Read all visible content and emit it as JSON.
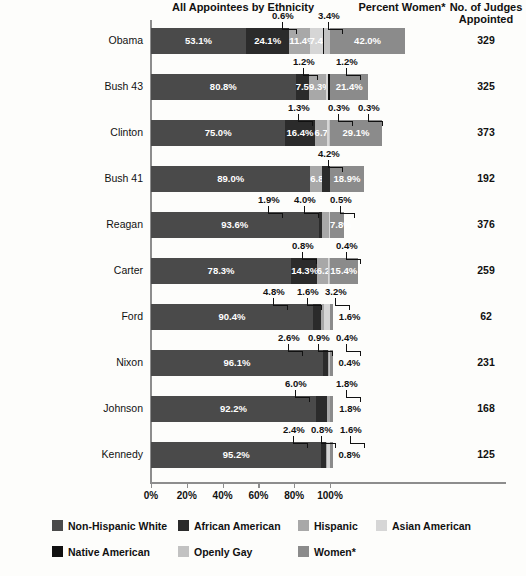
{
  "header": {
    "ethnicity_title": "All Appointees by Ethnicity",
    "women_title": "Percent Women*",
    "judges_title_line1": "No. of Judges",
    "judges_title_line2": "Appointed"
  },
  "axis": {
    "ticks": [
      "0%",
      "20%",
      "40%",
      "60%",
      "80%",
      "100%"
    ],
    "tick_values": [
      0,
      20,
      40,
      60,
      80,
      100
    ]
  },
  "legend": {
    "items": [
      {
        "label": "Non-Hispanic White",
        "color": "#4a4a4a"
      },
      {
        "label": "African American",
        "color": "#2b2b2b"
      },
      {
        "label": "Hispanic",
        "color": "#a8a8a8"
      },
      {
        "label": "Asian American",
        "color": "#d6d6d6"
      },
      {
        "label": "Native American",
        "color": "#111111"
      },
      {
        "label": "Openly Gay",
        "color": "#c2c2c2"
      },
      {
        "label": "Women*",
        "color": "#8b8b8b"
      }
    ]
  },
  "chart_data": {
    "type": "bar",
    "xlabel": "",
    "ylabel": "",
    "xlim": [
      0,
      100
    ],
    "grid": false,
    "orientation": "horizontal",
    "stacked": true,
    "legend_position": "bottom",
    "categories": [
      "Obama",
      "Bush 43",
      "Clinton",
      "Bush 41",
      "Reagan",
      "Carter",
      "Ford",
      "Nixon",
      "Johnson",
      "Kennedy"
    ],
    "series": [
      {
        "name": "Non-Hispanic White",
        "color": "#4a4a4a",
        "values": [
          53.1,
          80.8,
          75.0,
          89.0,
          93.6,
          78.3,
          90.4,
          96.1,
          92.2,
          95.2
        ]
      },
      {
        "name": "African American",
        "color": "#2b2b2b",
        "values": [
          24.1,
          7.5,
          16.4,
          6.8,
          1.9,
          14.3,
          4.8,
          2.6,
          6.0,
          2.4
        ]
      },
      {
        "name": "Hispanic",
        "color": "#a8a8a8",
        "values": [
          11.4,
          9.3,
          6.7,
          4.2,
          4.0,
          6.2,
          1.6,
          0.9,
          1.8,
          0.8
        ]
      },
      {
        "name": "Asian American",
        "color": "#d6d6d6",
        "values": [
          7.4,
          1.2,
          1.3,
          0.0,
          0.5,
          0.8,
          3.2,
          0.4,
          0.0,
          1.6
        ]
      },
      {
        "name": "Native American",
        "color": "#111111",
        "values": [
          0.6,
          1.2,
          0.3,
          0.0,
          0.0,
          0.0,
          0.0,
          0.0,
          0.0,
          0.0
        ]
      },
      {
        "name": "Openly Gay",
        "color": "#c2c2c2",
        "values": [
          3.4,
          0.3,
          0.0,
          0.0,
          0.0,
          0.4,
          1.6,
          0.4,
          1.8,
          0.8
        ]
      },
      {
        "name": "Women*",
        "color": "#8b8b8b",
        "values": [
          42.0,
          21.4,
          29.1,
          18.9,
          7.8,
          15.4,
          1.6,
          0.4,
          1.8,
          0.8
        ]
      }
    ],
    "judges_appointed": [
      329,
      325,
      373,
      192,
      376,
      259,
      62,
      231,
      168,
      125
    ]
  },
  "rows": [
    {
      "label": "Obama",
      "judges": "329",
      "segments": [
        {
          "name": "Non-Hispanic White",
          "value": 53.1,
          "text": "53.1%",
          "color": "#4a4a4a",
          "inline": true
        },
        {
          "name": "African American",
          "value": 24.1,
          "text": "24.1%",
          "color": "#2b2b2b",
          "inline": true
        },
        {
          "name": "Hispanic",
          "value": 11.4,
          "text": "11.4%",
          "color": "#a8a8a8",
          "inline": true
        },
        {
          "name": "Asian American",
          "value": 7.4,
          "text": "7.4%",
          "color": "#d6d6d6",
          "inline": true
        },
        {
          "name": "Native American",
          "value": 0.6,
          "text": "",
          "color": "#111111",
          "inline": false
        },
        {
          "name": "Openly Gay",
          "value": 3.4,
          "text": "",
          "color": "#c2c2c2",
          "inline": false
        }
      ],
      "women": {
        "value": 42.0,
        "text": "42.0%"
      },
      "callouts": [
        {
          "text": "0.6%",
          "x": 272,
          "y": -18,
          "leader_from": 297,
          "leader_to": 301,
          "style": "bracket-right"
        },
        {
          "text": "3.4%",
          "x": 318,
          "y": -18,
          "leader_from": 332,
          "leader_to": 336,
          "style": "bracket-left"
        }
      ]
    },
    {
      "label": "Bush 43",
      "judges": "325",
      "segments": [
        {
          "name": "Non-Hispanic White",
          "value": 80.8,
          "text": "80.8%",
          "color": "#4a4a4a",
          "inline": true
        },
        {
          "name": "African American",
          "value": 7.5,
          "text": "7.5%",
          "color": "#2b2b2b",
          "inline": true
        },
        {
          "name": "Hispanic",
          "value": 9.3,
          "text": "9.3%",
          "color": "#a8a8a8",
          "inline": true
        },
        {
          "name": "Asian American",
          "value": 1.2,
          "text": "",
          "color": "#d6d6d6",
          "inline": false
        },
        {
          "name": "Native American",
          "value": 1.2,
          "text": "",
          "color": "#111111",
          "inline": false
        }
      ],
      "women": {
        "value": 21.4,
        "text": "21.4%"
      },
      "callouts": [
        {
          "text": "1.2%",
          "x": 293,
          "y": -18
        },
        {
          "text": "1.2%",
          "x": 336,
          "y": -18
        }
      ]
    },
    {
      "label": "Clinton",
      "judges": "373",
      "segments": [
        {
          "name": "Non-Hispanic White",
          "value": 75.0,
          "text": "75.0%",
          "color": "#4a4a4a",
          "inline": true
        },
        {
          "name": "African American",
          "value": 16.4,
          "text": "16.4%",
          "color": "#2b2b2b",
          "inline": true
        },
        {
          "name": "Hispanic",
          "value": 6.7,
          "text": "6.7%",
          "color": "#a8a8a8",
          "inline": true
        },
        {
          "name": "Asian American",
          "value": 1.3,
          "text": "",
          "color": "#d6d6d6",
          "inline": false
        },
        {
          "name": "Native American",
          "value": 0.3,
          "text": "",
          "color": "#111111",
          "inline": false
        },
        {
          "name": "Openly Gay",
          "value": 0.3,
          "text": "",
          "color": "#c2c2c2",
          "inline": false
        }
      ],
      "women": {
        "value": 29.1,
        "text": "29.1%"
      },
      "callouts": [
        {
          "text": "1.3%",
          "x": 288,
          "y": -18
        },
        {
          "text": "0.3%",
          "x": 328,
          "y": -18
        },
        {
          "text": "0.3%",
          "x": 358,
          "y": -18
        }
      ]
    },
    {
      "label": "Bush 41",
      "judges": "192",
      "segments": [
        {
          "name": "Non-Hispanic White",
          "value": 89.0,
          "text": "89.0%",
          "color": "#4a4a4a",
          "inline": true
        },
        {
          "name": "Hispanic",
          "value": 6.8,
          "text": "6.8%",
          "color": "#a8a8a8",
          "inline": true
        },
        {
          "name": "African American",
          "value": 4.2,
          "text": "",
          "color": "#2b2b2b",
          "inline": false
        }
      ],
      "women": {
        "value": 18.9,
        "text": "18.9%"
      },
      "callouts": [
        {
          "text": "4.2%",
          "x": 318,
          "y": -18
        }
      ]
    },
    {
      "label": "Reagan",
      "judges": "376",
      "segments": [
        {
          "name": "Non-Hispanic White",
          "value": 93.6,
          "text": "93.6%",
          "color": "#4a4a4a",
          "inline": true
        },
        {
          "name": "African American",
          "value": 1.9,
          "text": "",
          "color": "#2b2b2b",
          "inline": false
        },
        {
          "name": "Hispanic",
          "value": 4.0,
          "text": "",
          "color": "#a8a8a8",
          "inline": false
        },
        {
          "name": "Asian American",
          "value": 0.5,
          "text": "",
          "color": "#d6d6d6",
          "inline": false
        }
      ],
      "women": {
        "value": 7.8,
        "text": "7.8%"
      },
      "callouts": [
        {
          "text": "1.9%",
          "x": 258,
          "y": -18
        },
        {
          "text": "4.0%",
          "x": 294,
          "y": -18
        },
        {
          "text": "0.5%",
          "x": 330,
          "y": -18
        }
      ]
    },
    {
      "label": "Carter",
      "judges": "259",
      "segments": [
        {
          "name": "Non-Hispanic White",
          "value": 78.3,
          "text": "78.3%",
          "color": "#4a4a4a",
          "inline": true
        },
        {
          "name": "African American",
          "value": 14.3,
          "text": "14.3%",
          "color": "#2b2b2b",
          "inline": true
        },
        {
          "name": "Hispanic",
          "value": 6.2,
          "text": "6.2%",
          "color": "#a8a8a8",
          "inline": true
        },
        {
          "name": "Asian American",
          "value": 0.8,
          "text": "",
          "color": "#d6d6d6",
          "inline": false
        },
        {
          "name": "Openly Gay",
          "value": 0.4,
          "text": "",
          "color": "#c2c2c2",
          "inline": false
        }
      ],
      "women": {
        "value": 15.4,
        "text": "15.4%"
      },
      "callouts": [
        {
          "text": "0.8%",
          "x": 292,
          "y": -18
        },
        {
          "text": "0.4%",
          "x": 336,
          "y": -18
        }
      ]
    },
    {
      "label": "Ford",
      "judges": "62",
      "segments": [
        {
          "name": "Non-Hispanic White",
          "value": 90.4,
          "text": "90.4%",
          "color": "#4a4a4a",
          "inline": true
        },
        {
          "name": "African American",
          "value": 4.8,
          "text": "",
          "color": "#2b2b2b",
          "inline": false
        },
        {
          "name": "Hispanic",
          "value": 1.6,
          "text": "",
          "color": "#a8a8a8",
          "inline": false
        },
        {
          "name": "Asian American",
          "value": 3.2,
          "text": "",
          "color": "#d6d6d6",
          "inline": false
        }
      ],
      "women": {
        "value": 1.6,
        "text": ""
      },
      "women_outside": "1.6%",
      "callouts": [
        {
          "text": "4.8%",
          "x": 263,
          "y": -18
        },
        {
          "text": "1.6%",
          "x": 297,
          "y": -18
        },
        {
          "text": "3.2%",
          "x": 325,
          "y": -18
        }
      ]
    },
    {
      "label": "Nixon",
      "judges": "231",
      "segments": [
        {
          "name": "Non-Hispanic White",
          "value": 96.1,
          "text": "96.1%",
          "color": "#4a4a4a",
          "inline": true
        },
        {
          "name": "African American",
          "value": 2.6,
          "text": "",
          "color": "#2b2b2b",
          "inline": false
        },
        {
          "name": "Hispanic",
          "value": 0.9,
          "text": "",
          "color": "#a8a8a8",
          "inline": false
        },
        {
          "name": "Openly Gay",
          "value": 0.4,
          "text": "",
          "color": "#c2c2c2",
          "inline": false
        }
      ],
      "women": {
        "value": 0.4,
        "text": ""
      },
      "women_outside": "0.4%",
      "callouts": [
        {
          "text": "2.6%",
          "x": 278,
          "y": -18
        },
        {
          "text": "0.9%",
          "x": 308,
          "y": -18
        },
        {
          "text": "0.4%",
          "x": 336,
          "y": -18
        }
      ]
    },
    {
      "label": "Johnson",
      "judges": "168",
      "segments": [
        {
          "name": "Non-Hispanic White",
          "value": 92.2,
          "text": "92.2%",
          "color": "#4a4a4a",
          "inline": true
        },
        {
          "name": "African American",
          "value": 6.0,
          "text": "",
          "color": "#2b2b2b",
          "inline": false
        },
        {
          "name": "Hispanic",
          "value": 1.8,
          "text": "",
          "color": "#a8a8a8",
          "inline": false
        }
      ],
      "women": {
        "value": 1.8,
        "text": ""
      },
      "women_outside": "1.8%",
      "callouts": [
        {
          "text": "6.0%",
          "x": 285,
          "y": -18
        },
        {
          "text": "1.8%",
          "x": 336,
          "y": -18
        }
      ]
    },
    {
      "label": "Kennedy",
      "judges": "125",
      "segments": [
        {
          "name": "Non-Hispanic White",
          "value": 95.2,
          "text": "95.2%",
          "color": "#4a4a4a",
          "inline": true
        },
        {
          "name": "African American",
          "value": 2.4,
          "text": "",
          "color": "#2b2b2b",
          "inline": false
        },
        {
          "name": "Hispanic",
          "value": 0.8,
          "text": "",
          "color": "#a8a8a8",
          "inline": false
        },
        {
          "name": "Asian American",
          "value": 1.6,
          "text": "",
          "color": "#d6d6d6",
          "inline": false
        }
      ],
      "women": {
        "value": 0.8,
        "text": ""
      },
      "women_outside": "0.8%",
      "callouts": [
        {
          "text": "2.4%",
          "x": 283,
          "y": -18
        },
        {
          "text": "0.8%",
          "x": 311,
          "y": -18
        },
        {
          "text": "1.6%",
          "x": 340,
          "y": -18
        }
      ]
    }
  ]
}
